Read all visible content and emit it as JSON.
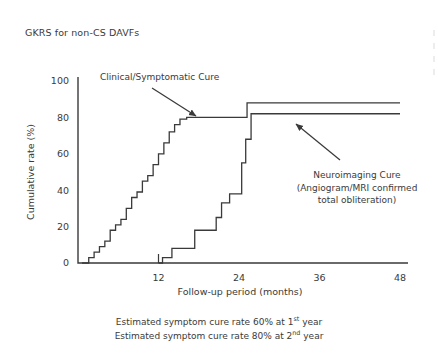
{
  "slide": {
    "title": "GKRS for non-CS DAVFs",
    "background_color": "#ffffff",
    "text_color": "#3a3a3a"
  },
  "caption": {
    "line1_pre": "Estimated symptom cure rate 60% at 1",
    "line1_sup": "st",
    "line1_post": " year",
    "line2_pre": "Estimated symptom cure rate 80% at 2",
    "line2_sup": "nd",
    "line2_post": " year"
  },
  "chart_data": {
    "type": "line",
    "title": "",
    "xlabel": "Follow-up period (months)",
    "ylabel": "Cumulative rate (%)",
    "xlim": [
      0,
      48
    ],
    "ylim": [
      0,
      105
    ],
    "xticks": [
      12,
      24,
      36,
      48
    ],
    "xticklabels": [
      "12",
      "24",
      "36",
      "48"
    ],
    "yticks": [
      0,
      20,
      40,
      60,
      80,
      100
    ],
    "yticklabels": [
      "0",
      "20",
      "40",
      "60",
      "80",
      "100"
    ],
    "grid": false,
    "legend": "none",
    "line_color": "#3a3a3a",
    "line_width": 1.3,
    "series": [
      {
        "name": "Clinical/Symptomatic Cure",
        "step": "post",
        "x": [
          0.6,
          1.6,
          2.4,
          3.2,
          4.0,
          4.8,
          5.6,
          6.4,
          7.2,
          8.0,
          8.8,
          9.6,
          10.4,
          11.2,
          12.0,
          12.8,
          13.6,
          14.4,
          15.2,
          16.2,
          24.2,
          25.2,
          48
        ],
        "y": [
          0,
          3,
          6,
          9,
          12,
          18,
          21,
          24,
          30,
          36,
          39,
          45,
          48,
          54,
          60,
          66,
          72,
          76,
          79,
          80,
          80,
          88,
          88
        ]
      },
      {
        "name": "Neuroimaging Cure (Angiogram/MRI confirmed total obliteration)",
        "step": "post",
        "x": [
          12.0,
          12.6,
          14.0,
          15.0,
          17.4,
          19.0,
          20.6,
          21.4,
          22.6,
          23.4,
          24.4,
          25.0,
          25.8,
          48
        ],
        "y": [
          0,
          3,
          8,
          8,
          18,
          18,
          25,
          33,
          38,
          38,
          55,
          68,
          82,
          82
        ]
      }
    ],
    "annotations": [
      {
        "id": "clinical-annotation",
        "text_lines": [
          "Clinical/Symptomatic Cure"
        ],
        "text_x": 100,
        "text_y": 80,
        "arrow_from": [
          152,
          88
        ],
        "arrow_to": [
          196,
          116
        ]
      },
      {
        "id": "neuroimaging-annotation",
        "text_lines": [
          "Neuroimaging Cure",
          "(Angiogram/MRI confirmed",
          "total obliteration)"
        ],
        "text_x": 357,
        "text_y": 178,
        "arrow_from": [
          340,
          160
        ],
        "arrow_to": [
          296,
          124
        ]
      }
    ]
  }
}
